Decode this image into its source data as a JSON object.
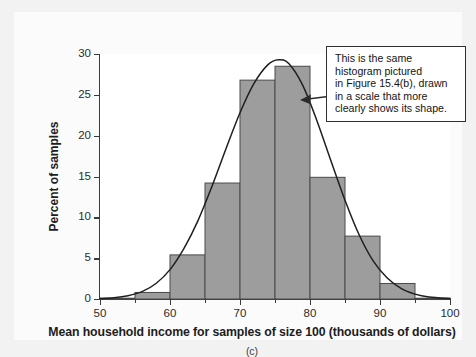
{
  "chart_data": {
    "type": "bar",
    "title": "",
    "subtitle": "",
    "xlabel": "Mean household income for samples of size 100 (thousands of dollars)",
    "ylabel": "Percent of samples",
    "panel_label": "(c)",
    "xlim": [
      50,
      100
    ],
    "ylim": [
      0,
      30
    ],
    "grid": false,
    "legend": null,
    "bin_width": 5,
    "bin_edges": [
      50,
      55,
      60,
      65,
      70,
      75,
      80,
      85,
      90,
      95,
      100
    ],
    "categories": [
      "50-55",
      "55-60",
      "60-65",
      "65-70",
      "70-75",
      "75-80",
      "80-85",
      "85-90",
      "90-95",
      "95-100"
    ],
    "values": [
      0.1,
      0.8,
      5.4,
      14.2,
      26.8,
      28.5,
      14.9,
      7.7,
      1.9,
      0.1
    ],
    "xticks": [
      50,
      60,
      70,
      80,
      90,
      100
    ],
    "yticks": [
      0,
      5,
      10,
      15,
      20,
      25,
      30
    ],
    "series": [
      {
        "name": "Percent of samples",
        "kind": "bar",
        "values": [
          0.1,
          0.8,
          5.4,
          14.2,
          26.8,
          28.5,
          14.9,
          7.7,
          1.9,
          0.1
        ]
      },
      {
        "name": "Normal curve overlay",
        "kind": "line",
        "peak_x": 75.5,
        "peak_y": 29.3,
        "x": [
          50,
          52,
          54,
          56,
          58,
          60,
          62,
          64,
          66,
          68,
          70,
          72,
          74,
          75.5,
          77,
          79,
          81,
          83,
          85,
          87,
          89,
          91,
          93,
          95,
          97,
          100
        ],
        "y": [
          0.05,
          0.15,
          0.4,
          0.9,
          1.9,
          3.6,
          6.2,
          9.6,
          13.8,
          18.4,
          22.8,
          26.4,
          28.7,
          29.3,
          28.8,
          26.1,
          21.8,
          16.9,
          12.1,
          7.9,
          4.7,
          2.6,
          1.3,
          0.6,
          0.25,
          0.05
        ]
      }
    ],
    "annotation": {
      "text": "This is the same histogram pictured in Figure 15.4(b), drawn in a scale that more clearly shows its shape.",
      "lines": [
        "This is the same",
        "histogram pictured",
        "in Figure 15.4(b), drawn",
        "in a scale that more",
        "clearly shows its shape."
      ],
      "points_to": "normal-curve"
    },
    "colors": {
      "bar_fill": "#9d9d9d",
      "bar_stroke": "#4a4a4a",
      "curve": "#1f1f1f",
      "axis": "#3a3a3a",
      "plot_background": "#ffffff",
      "figure_background": "#fbfbfb",
      "page_background": "#f2f2f2",
      "annotation_border": "#2f2f2f",
      "text": "#1d1d1d"
    }
  }
}
